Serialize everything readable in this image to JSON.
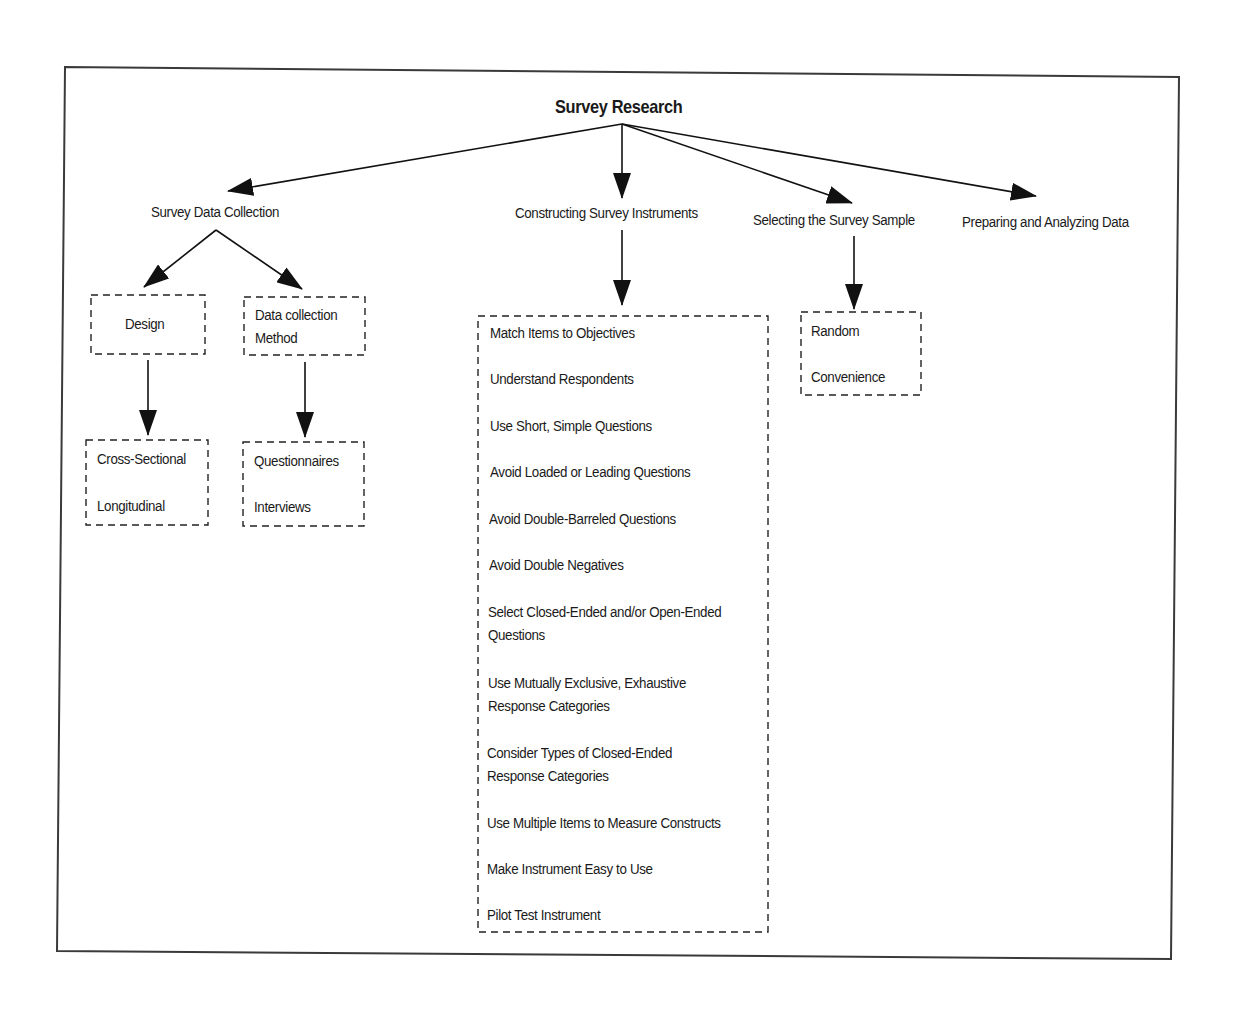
{
  "diagram": {
    "title": "Survey Research",
    "branches": [
      {
        "label": "Survey Data Collection",
        "children": [
          {
            "label": "Design",
            "items": [
              "Cross-Sectional",
              "Longitudinal"
            ]
          },
          {
            "label_lines": [
              "Data collection",
              "Method"
            ],
            "items": [
              "Questionnaires",
              "Interviews"
            ]
          }
        ]
      },
      {
        "label": "Constructing Survey Instruments",
        "items": [
          {
            "lines": [
              "Match Items to Objectives"
            ]
          },
          {
            "lines": [
              "Understand Respondents"
            ]
          },
          {
            "lines": [
              "Use Short, Simple Questions"
            ]
          },
          {
            "lines": [
              "Avoid Loaded or Leading Questions"
            ]
          },
          {
            "lines": [
              "Avoid Double-Barreled Questions"
            ]
          },
          {
            "lines": [
              "Avoid Double Negatives"
            ]
          },
          {
            "lines": [
              "Select Closed-Ended and/or Open-Ended",
              "Questions"
            ]
          },
          {
            "lines": [
              "Use Mutually Exclusive, Exhaustive",
              "Response Categories"
            ]
          },
          {
            "lines": [
              "Consider Types of Closed-Ended",
              "Response Categories"
            ]
          },
          {
            "lines": [
              "Use Multiple Items to Measure Constructs"
            ]
          },
          {
            "lines": [
              "Make Instrument Easy to Use"
            ]
          },
          {
            "lines": [
              "Pilot Test Instrument"
            ]
          }
        ]
      },
      {
        "label": "Selecting the Survey Sample",
        "items": [
          "Random",
          "Convenience"
        ]
      },
      {
        "label": "Preparing and Analyzing Data"
      }
    ]
  },
  "colors": {
    "line": "#1a1a1a",
    "frame": "#3a3a3a",
    "background": "#ffffff"
  }
}
